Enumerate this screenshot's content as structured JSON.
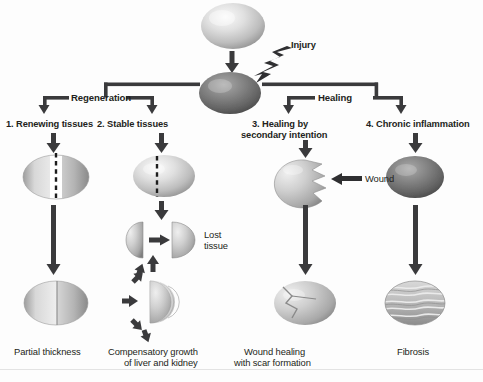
{
  "figure": {
    "domain": "biology-diagram"
  },
  "nodes": {
    "normal_tissue": "normal-tissue-ovoid",
    "injured_tissue": "injured-tissue-ovoid",
    "injury_label": "Injury",
    "wound_label": "Wound",
    "lost_tissue_label": "Lost\ntissue",
    "lost_tissue_line1": "Lost",
    "lost_tissue_line2": "tissue"
  },
  "branches": {
    "left_group_label": "Regeneration",
    "right_group_label": "Healing"
  },
  "columns": [
    {
      "id": "renewing",
      "heading_line1": "1. Renewing tissues",
      "heading_line2": "",
      "caption_line1": "Partial thickness",
      "caption_line2": ""
    },
    {
      "id": "stable",
      "heading_line1": "2. Stable tissues",
      "heading_line2": "",
      "caption_line1": "Compensatory growth",
      "caption_line2": "of liver and kidney"
    },
    {
      "id": "secondary-intention",
      "heading_line1": "3. Healing by",
      "heading_line2": "secondary intention",
      "caption_line1": "Wound healing",
      "caption_line2": "with scar formation"
    },
    {
      "id": "chronic-inflammation",
      "heading_line1": "4. Chronic inflammation",
      "heading_line2": "",
      "caption_line1": "Fibrosis",
      "caption_line2": ""
    }
  ],
  "colors": {
    "ink": "#231f20",
    "arrow": "#3a3a3c",
    "tissue_light_hi": "#f2f2f2",
    "tissue_light_mid": "#c9c9c9",
    "tissue_light_low": "#8f8f8f",
    "tissue_dark_hi": "#9a9a9a",
    "tissue_dark_mid": "#6f6f6f",
    "tissue_dark_low": "#4a4a4a",
    "background": "#ffffff",
    "baseline_rule": "#e3e3e3"
  }
}
